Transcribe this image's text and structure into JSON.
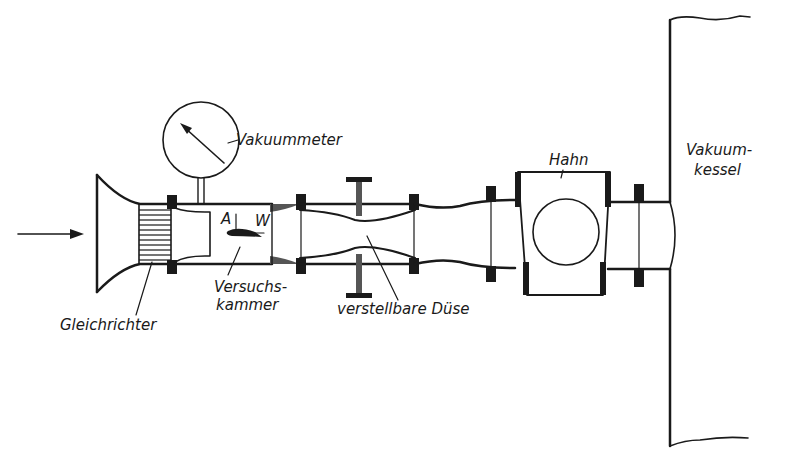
{
  "diagram": {
    "colors": {
      "ink": "#1a1a1a",
      "background": "#ffffff"
    },
    "labels": {
      "vakuummeter": "Vakuummeter",
      "point_a": "A",
      "point_w": "W",
      "hahn": "Hahn",
      "vakuumkessel_1": "Vakuum-",
      "vakuumkessel_2": "kessel",
      "versuchskammer_1": "Versuchs-",
      "versuchskammer_2": "kammer",
      "gleichrichter": "Gleichrichter",
      "duese": "verstellbare Düse"
    },
    "components": [
      "flow-arrow",
      "inlet-bell",
      "flow-straightener",
      "test-chamber",
      "vacuum-gauge",
      "airfoil-model",
      "adjustable-nozzle",
      "diffuser",
      "valve",
      "vacuum-tank"
    ]
  }
}
